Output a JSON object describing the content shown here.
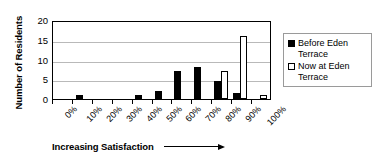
{
  "chart_data": {
    "type": "bar",
    "title": "",
    "xlabel": "Increasing Satisfaction",
    "ylabel": "Number of Residents",
    "categories": [
      "0%",
      "10%",
      "20%",
      "30%",
      "40%",
      "50%",
      "60%",
      "70%",
      "80%",
      "90%",
      "100%"
    ],
    "series": [
      {
        "name": "Before Eden Terrace",
        "color": "#000000",
        "values": [
          0,
          1,
          0,
          0,
          1,
          2,
          7,
          8,
          4.5,
          1.5,
          0
        ]
      },
      {
        "name": "Now at Eden Terrace",
        "color": "#ffffff",
        "values": [
          0,
          0,
          0,
          0,
          0,
          0,
          0,
          0,
          7,
          16,
          1
        ]
      }
    ],
    "ylim": [
      0,
      20
    ],
    "yticks": [
      0,
      5,
      10,
      15,
      20
    ],
    "ytick_labels": [
      "0",
      "5",
      "10",
      "15",
      "20"
    ],
    "grid": true,
    "legend_position": "right",
    "axis_arrow": "right-arrow"
  },
  "axes": {
    "y_title": "Number of Residents",
    "x_title": "Increasing Satisfaction"
  },
  "legend": {
    "entries": [
      {
        "label": "Before Eden Terrace",
        "swatch": "filled-square"
      },
      {
        "label": "Now at Eden Terrace",
        "swatch": "open-square"
      }
    ]
  }
}
